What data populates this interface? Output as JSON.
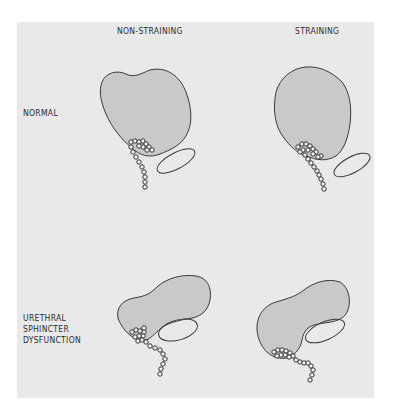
{
  "columns": [
    {
      "label": "NON-STRAINING"
    },
    {
      "label": "STRAINING"
    }
  ],
  "rows": [
    {
      "label": "NORMAL"
    },
    {
      "label": "URETHRAL\nSPHINCTER\nDYSFUNCTION"
    }
  ],
  "colors": {
    "background": "#e9e9e9",
    "bladder_fill": "#c9c9c9",
    "outline": "#3a3a3a"
  }
}
